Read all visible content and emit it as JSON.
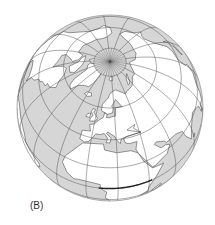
{
  "figure": {
    "panel_label": "(B)",
    "projection": "orthographic",
    "center": {
      "lat": 60,
      "lon": 15
    },
    "globe": {
      "cx": 110,
      "cy": 108,
      "r": 93
    },
    "graticule": {
      "parallels_deg": [
        -60,
        -40,
        -20,
        0,
        20,
        40,
        60,
        80
      ],
      "meridian_step_deg": 20,
      "meridian_min_lat": -90,
      "meridian_max_lat": 80
    },
    "polar_cap_lat": 80,
    "equator_segment": {
      "from_lon": 8,
      "to_lon": 42,
      "lat": 0
    },
    "colors": {
      "ocean": "#d6d6d6",
      "land": "#ffffff",
      "grid": "#555555",
      "coast": "#444444",
      "rim": "#9a9a9a",
      "equator_highlight": "#222222"
    },
    "landmasses": [
      {
        "name": "africa",
        "coords": [
          [
            -17,
            15
          ],
          [
            -16,
            21
          ],
          [
            -10,
            30
          ],
          [
            -6,
            35
          ],
          [
            10,
            37
          ],
          [
            11,
            33
          ],
          [
            20,
            31
          ],
          [
            30,
            31
          ],
          [
            32,
            30
          ],
          [
            35,
            28
          ],
          [
            38,
            20
          ],
          [
            43,
            12
          ],
          [
            51,
            11
          ],
          [
            45,
            2
          ],
          [
            40,
            -8
          ],
          [
            40,
            -15
          ],
          [
            35,
            -25
          ],
          [
            32,
            -30
          ],
          [
            25,
            -34
          ],
          [
            18,
            -34
          ],
          [
            15,
            -25
          ],
          [
            12,
            -15
          ],
          [
            13,
            -5
          ],
          [
            9,
            0
          ],
          [
            9,
            4
          ],
          [
            5,
            5
          ],
          [
            -5,
            5
          ],
          [
            -8,
            4
          ],
          [
            -13,
            8
          ],
          [
            -17,
            15
          ]
        ]
      },
      {
        "name": "madagascar",
        "coords": [
          [
            44,
            -25
          ],
          [
            47,
            -25
          ],
          [
            50,
            -15
          ],
          [
            49,
            -12
          ],
          [
            44,
            -17
          ],
          [
            44,
            -25
          ]
        ]
      },
      {
        "name": "europe",
        "coords": [
          [
            -9,
            37
          ],
          [
            -9,
            43
          ],
          [
            -2,
            44
          ],
          [
            -4,
            48
          ],
          [
            0,
            49
          ],
          [
            4,
            52
          ],
          [
            8,
            54
          ],
          [
            9,
            57
          ],
          [
            12,
            56
          ],
          [
            11,
            54
          ],
          [
            14,
            54
          ],
          [
            21,
            55
          ],
          [
            22,
            60
          ],
          [
            25,
            60
          ],
          [
            30,
            60
          ],
          [
            23,
            65
          ],
          [
            20,
            63
          ],
          [
            17,
            61
          ],
          [
            19,
            60
          ],
          [
            18,
            57
          ],
          [
            12,
            56
          ],
          [
            5,
            58
          ],
          [
            5,
            62
          ],
          [
            12,
            66
          ],
          [
            15,
            69
          ],
          [
            25,
            71
          ],
          [
            30,
            70
          ],
          [
            40,
            67
          ],
          [
            44,
            68
          ],
          [
            55,
            69
          ],
          [
            60,
            70
          ],
          [
            70,
            73
          ],
          [
            80,
            73
          ],
          [
            90,
            76
          ],
          [
            105,
            78
          ],
          [
            115,
            74
          ],
          [
            130,
            72
          ],
          [
            140,
            72
          ],
          [
            150,
            71
          ],
          [
            160,
            70
          ],
          [
            170,
            69
          ],
          [
            180,
            66
          ],
          [
            175,
            62
          ],
          [
            165,
            60
          ],
          [
            160,
            55
          ],
          [
            155,
            58
          ],
          [
            150,
            59
          ],
          [
            140,
            54
          ],
          [
            135,
            45
          ],
          [
            130,
            42
          ],
          [
            122,
            40
          ],
          [
            120,
            33
          ],
          [
            122,
            30
          ],
          [
            118,
            24
          ],
          [
            110,
            21
          ],
          [
            108,
            15
          ],
          [
            105,
            10
          ],
          [
            100,
            13
          ],
          [
            100,
            5
          ],
          [
            104,
            2
          ],
          [
            98,
            8
          ],
          [
            97,
            16
          ],
          [
            92,
            20
          ],
          [
            88,
            22
          ],
          [
            80,
            15
          ],
          [
            77,
            8
          ],
          [
            73,
            16
          ],
          [
            72,
            22
          ],
          [
            66,
            25
          ],
          [
            57,
            25
          ],
          [
            56,
            27
          ],
          [
            50,
            30
          ],
          [
            48,
            29
          ],
          [
            52,
            24
          ],
          [
            56,
            24
          ],
          [
            59,
            22
          ],
          [
            55,
            17
          ],
          [
            45,
            13
          ],
          [
            43,
            13
          ],
          [
            39,
            21
          ],
          [
            35,
            28
          ],
          [
            34,
            31
          ],
          [
            36,
            36
          ],
          [
            30,
            36
          ],
          [
            27,
            37
          ],
          [
            26,
            40
          ],
          [
            29,
            41
          ],
          [
            41,
            41
          ],
          [
            30,
            45
          ],
          [
            33,
            46
          ],
          [
            38,
            47
          ],
          [
            36,
            45
          ],
          [
            41,
            41
          ],
          [
            28,
            41
          ],
          [
            24,
            40
          ],
          [
            23,
            37
          ],
          [
            20,
            40
          ],
          [
            19,
            42
          ],
          [
            13,
            45
          ],
          [
            12,
            44
          ],
          [
            16,
            41
          ],
          [
            15,
            38
          ],
          [
            12,
            38
          ],
          [
            13,
            41
          ],
          [
            10,
            44
          ],
          [
            7,
            43
          ],
          [
            3,
            43
          ],
          [
            0,
            39
          ],
          [
            -2,
            37
          ],
          [
            -5,
            36
          ],
          [
            -9,
            37
          ]
        ]
      },
      {
        "name": "britain",
        "coords": [
          [
            -5,
            50
          ],
          [
            1,
            51
          ],
          [
            2,
            53
          ],
          [
            -3,
            56
          ],
          [
            -2,
            58
          ],
          [
            -5,
            58
          ],
          [
            -6,
            56
          ],
          [
            -3,
            54
          ],
          [
            -5,
            52
          ],
          [
            -5,
            50
          ]
        ]
      },
      {
        "name": "ireland",
        "coords": [
          [
            -10,
            52
          ],
          [
            -6,
            52
          ],
          [
            -6,
            55
          ],
          [
            -9,
            54
          ],
          [
            -10,
            52
          ]
        ]
      },
      {
        "name": "iceland",
        "coords": [
          [
            -24,
            64
          ],
          [
            -22,
            66
          ],
          [
            -15,
            66.5
          ],
          [
            -13,
            65
          ],
          [
            -18,
            63.5
          ],
          [
            -24,
            64
          ]
        ]
      },
      {
        "name": "greenland",
        "coords": [
          [
            -73,
            78
          ],
          [
            -60,
            82
          ],
          [
            -40,
            83
          ],
          [
            -20,
            82
          ],
          [
            -18,
            77
          ],
          [
            -22,
            72
          ],
          [
            -25,
            69
          ],
          [
            -32,
            68
          ],
          [
            -40,
            65
          ],
          [
            -43,
            60
          ],
          [
            -48,
            61
          ],
          [
            -52,
            65
          ],
          [
            -54,
            70
          ],
          [
            -58,
            75
          ],
          [
            -68,
            76
          ],
          [
            -73,
            78
          ]
        ]
      },
      {
        "name": "north-america",
        "coords": [
          [
            -168,
            66
          ],
          [
            -160,
            70
          ],
          [
            -150,
            71
          ],
          [
            -140,
            70
          ],
          [
            -128,
            70
          ],
          [
            -115,
            68
          ],
          [
            -100,
            68
          ],
          [
            -95,
            72
          ],
          [
            -85,
            70
          ],
          [
            -82,
            66
          ],
          [
            -88,
            64
          ],
          [
            -94,
            60
          ],
          [
            -93,
            57
          ],
          [
            -85,
            55
          ],
          [
            -80,
            52
          ],
          [
            -79,
            56
          ],
          [
            -77,
            60
          ],
          [
            -73,
            62
          ],
          [
            -65,
            60
          ],
          [
            -61,
            56
          ],
          [
            -56,
            52
          ],
          [
            -60,
            48
          ],
          [
            -65,
            47
          ],
          [
            -64,
            45
          ],
          [
            -70,
            43
          ],
          [
            -71,
            41
          ],
          [
            -74,
            40
          ],
          [
            -76,
            35
          ],
          [
            -80,
            32
          ],
          [
            -81,
            25
          ],
          [
            -83,
            29
          ],
          [
            -90,
            30
          ],
          [
            -97,
            27
          ],
          [
            -97,
            21
          ],
          [
            -90,
            21
          ],
          [
            -87,
            16
          ],
          [
            -83,
            10
          ],
          [
            -78,
            8
          ],
          [
            -80,
            4
          ],
          [
            -82,
            8
          ],
          [
            -86,
            12
          ],
          [
            -92,
            15
          ],
          [
            -105,
            20
          ],
          [
            -110,
            24
          ],
          [
            -115,
            30
          ],
          [
            -118,
            34
          ],
          [
            -124,
            40
          ],
          [
            -124,
            48
          ],
          [
            -130,
            55
          ],
          [
            -140,
            60
          ],
          [
            -150,
            60
          ],
          [
            -158,
            57
          ],
          [
            -165,
            60
          ],
          [
            -168,
            66
          ]
        ]
      },
      {
        "name": "south-america",
        "coords": [
          [
            -78,
            8
          ],
          [
            -72,
            12
          ],
          [
            -62,
            10
          ],
          [
            -52,
            5
          ],
          [
            -50,
            0
          ],
          [
            -44,
            -2
          ],
          [
            -35,
            -5
          ],
          [
            -35,
            -10
          ],
          [
            -39,
            -15
          ],
          [
            -40,
            -22
          ],
          [
            -48,
            -26
          ],
          [
            -53,
            -34
          ],
          [
            -58,
            -38
          ],
          [
            -65,
            -42
          ],
          [
            -68,
            -52
          ],
          [
            -72,
            -50
          ],
          [
            -74,
            -40
          ],
          [
            -71,
            -30
          ],
          [
            -70,
            -18
          ],
          [
            -76,
            -14
          ],
          [
            -81,
            -5
          ],
          [
            -80,
            0
          ],
          [
            -78,
            8
          ]
        ]
      },
      {
        "name": "canadian-arctic",
        "coords": [
          [
            -95,
            74
          ],
          [
            -80,
            74
          ],
          [
            -70,
            72
          ],
          [
            -62,
            67
          ],
          [
            -65,
            64
          ],
          [
            -75,
            64
          ],
          [
            -80,
            70
          ],
          [
            -90,
            72
          ],
          [
            -95,
            74
          ]
        ]
      },
      {
        "name": "ellesmere",
        "coords": [
          [
            -90,
            80
          ],
          [
            -75,
            83
          ],
          [
            -65,
            82
          ],
          [
            -75,
            78
          ],
          [
            -85,
            77
          ],
          [
            -90,
            80
          ]
        ]
      },
      {
        "name": "svalbard",
        "coords": [
          [
            12,
            78
          ],
          [
            18,
            80
          ],
          [
            25,
            80
          ],
          [
            22,
            77
          ],
          [
            15,
            77
          ],
          [
            12,
            78
          ]
        ]
      },
      {
        "name": "novaya-zemlya",
        "coords": [
          [
            52,
            71
          ],
          [
            57,
            75
          ],
          [
            68,
            77
          ],
          [
            60,
            73
          ],
          [
            55,
            71
          ],
          [
            52,
            71
          ]
        ]
      },
      {
        "name": "japan",
        "coords": [
          [
            130,
            31
          ],
          [
            135,
            34
          ],
          [
            140,
            36
          ],
          [
            142,
            40
          ],
          [
            141,
            45
          ],
          [
            140,
            41
          ],
          [
            136,
            36
          ],
          [
            131,
            34
          ],
          [
            130,
            31
          ]
        ]
      },
      {
        "name": "arabian-horn-sri",
        "coords": [
          [
            80,
            6
          ],
          [
            82,
            7
          ],
          [
            81,
            9
          ],
          [
            80,
            6
          ]
        ]
      }
    ]
  }
}
